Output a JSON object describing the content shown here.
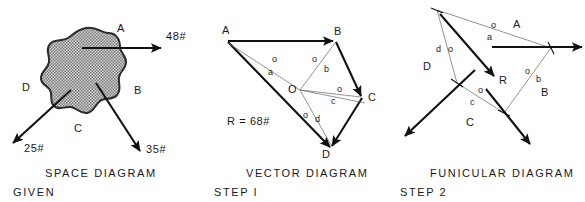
{
  "figure": {
    "kind": "engineering-graphic-statics-plate",
    "panels": [
      {
        "id": "space",
        "caption": "SPACE  DIAGRAM",
        "sub_caption": "GIVEN",
        "space_labels": [
          "A",
          "B",
          "C",
          "D"
        ],
        "forces": [
          {
            "name": "A",
            "magnitude": "48",
            "unit": "#",
            "label": "48#",
            "direction": "right"
          },
          {
            "name": "B",
            "magnitude": "35",
            "unit": "#",
            "label": "35#",
            "direction": "down-right"
          },
          {
            "name": "D",
            "magnitude": "25",
            "unit": "#",
            "label": "25#",
            "direction": "down-left"
          }
        ],
        "body": "irregular-stippled-blob"
      },
      {
        "id": "vector",
        "caption": "VECTOR  DIAGRAM",
        "sub_caption": "STEP I",
        "vertices": [
          "A",
          "B",
          "C",
          "D"
        ],
        "pole": "O",
        "resultant": {
          "symbol": "R",
          "equals": "=",
          "magnitude": "68",
          "unit": "#",
          "label": "R = 68#"
        },
        "rays": [
          "oa",
          "ob",
          "oc",
          "od"
        ],
        "ray_labels": [
          {
            "pole": "o",
            "ray": "a"
          },
          {
            "pole": "o",
            "ray": "b"
          },
          {
            "pole": "o",
            "ray": "c"
          },
          {
            "pole": "o",
            "ray": "d"
          }
        ]
      },
      {
        "id": "funicular",
        "caption": "FUNICULAR  DIAGRAM",
        "sub_caption": "STEP 2",
        "space_labels": [
          "A",
          "B",
          "C",
          "D"
        ],
        "resultant_label": "R",
        "string_labels": [
          {
            "pole": "o",
            "ray": "a"
          },
          {
            "pole": "o",
            "ray": "b"
          },
          {
            "pole": "o",
            "ray": "c"
          },
          {
            "pole": "o",
            "ray": "d"
          }
        ]
      }
    ],
    "colors": {
      "ink": "#1a1a1a",
      "heavy_line": "#111111",
      "light_line": "#6f6f6f",
      "blob_fill": "#b8b8b8",
      "blob_outline": "#2b2b2b",
      "paper": "#ffffff"
    }
  }
}
